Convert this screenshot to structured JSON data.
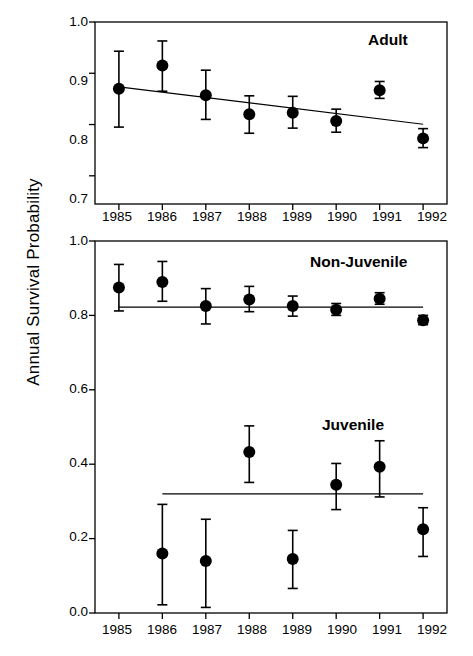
{
  "figure": {
    "ylabel": "Annual Survival Probability",
    "marker_color": "#000000",
    "line_color": "#000000",
    "frame_color": "#000000",
    "background": "#ffffff"
  },
  "chart_data": [
    {
      "type": "scatter",
      "panel": "top",
      "title": "",
      "series_label": "Adult",
      "xlabel": "",
      "ylabel": "Annual Survival Probability",
      "categories": [
        "1985",
        "1986",
        "1987",
        "1988",
        "1989",
        "1990",
        "1991",
        "1992"
      ],
      "x": [
        1985,
        1986,
        1987,
        1988,
        1989,
        1990,
        1991,
        1992
      ],
      "values": [
        0.87,
        0.915,
        0.857,
        0.82,
        0.823,
        0.807,
        0.867,
        0.773
      ],
      "error_low": [
        0.795,
        0.865,
        0.81,
        0.783,
        0.793,
        0.785,
        0.851,
        0.755
      ],
      "error_high": [
        0.943,
        0.963,
        0.906,
        0.856,
        0.855,
        0.83,
        0.884,
        0.792
      ],
      "trend_line": {
        "x_start": 1985,
        "y_start": 0.8735,
        "x_end": 1992,
        "y_end": 0.8005
      },
      "ylim": [
        0.645,
        1.0
      ],
      "yticks": [
        0.7,
        0.8,
        0.9,
        1.0
      ],
      "ytick_labels": [
        "0.7",
        "0.8",
        "0.9",
        "1.0"
      ],
      "xlim": [
        1984.45,
        1992.55
      ],
      "grid": false,
      "legend": "none",
      "error_bar_type": "95% confidence interval"
    },
    {
      "type": "scatter",
      "panel": "bottom",
      "title": "",
      "xlabel": "",
      "ylabel": "Annual Survival Probability",
      "categories": [
        "1985",
        "1986",
        "1987",
        "1988",
        "1989",
        "1990",
        "1991",
        "1992"
      ],
      "x": [
        1985,
        1986,
        1987,
        1988,
        1989,
        1990,
        1991,
        1992
      ],
      "ylim": [
        0.0,
        1.0
      ],
      "yticks": [
        0.0,
        0.2,
        0.4,
        0.6,
        0.8,
        1.0
      ],
      "ytick_labels": [
        "0.0",
        "0.2",
        "0.4",
        "0.6",
        "0.8",
        "1.0"
      ],
      "xlim": [
        1984.45,
        1992.55
      ],
      "grid": false,
      "legend": "none",
      "error_bar_type": "95% confidence interval",
      "series": [
        {
          "name": "Non-Juvenile",
          "values": [
            0.875,
            0.89,
            0.825,
            0.843,
            0.825,
            0.815,
            0.845,
            0.787
          ],
          "error_low": [
            0.812,
            0.838,
            0.777,
            0.81,
            0.798,
            0.8,
            0.83,
            0.775
          ],
          "error_high": [
            0.937,
            0.945,
            0.872,
            0.878,
            0.852,
            0.832,
            0.861,
            0.8
          ],
          "trend_line": {
            "x_start": 1985,
            "y_start": 0.822,
            "x_end": 1992,
            "y_end": 0.822
          }
        },
        {
          "name": "Juvenile",
          "values": [
            null,
            0.16,
            0.14,
            0.433,
            0.145,
            0.345,
            0.393,
            0.225
          ],
          "error_low": [
            null,
            0.022,
            0.015,
            0.351,
            0.066,
            0.278,
            0.312,
            0.152
          ],
          "error_high": [
            null,
            0.292,
            0.252,
            0.503,
            0.222,
            0.402,
            0.463,
            0.283
          ],
          "trend_line": {
            "x_start": 1986,
            "y_start": 0.32,
            "x_end": 1992,
            "y_end": 0.32
          }
        }
      ]
    }
  ],
  "top_panel": {
    "series_label": "Adult",
    "ytick_labels": [
      "1.0",
      "0.9",
      "0.8",
      "0.7"
    ],
    "xtick_labels": [
      "1985",
      "1986",
      "1987",
      "1988",
      "1989",
      "1990",
      "1991",
      "1992"
    ]
  },
  "bottom_panel": {
    "series_label_upper": "Non-Juvenile",
    "series_label_lower": "Juvenile",
    "ytick_labels": [
      "1.0",
      "0.8",
      "0.6",
      "0.4",
      "0.2",
      "0.0"
    ],
    "xtick_labels": [
      "1985",
      "1986",
      "1987",
      "1988",
      "1989",
      "1990",
      "1991",
      "1992"
    ]
  }
}
